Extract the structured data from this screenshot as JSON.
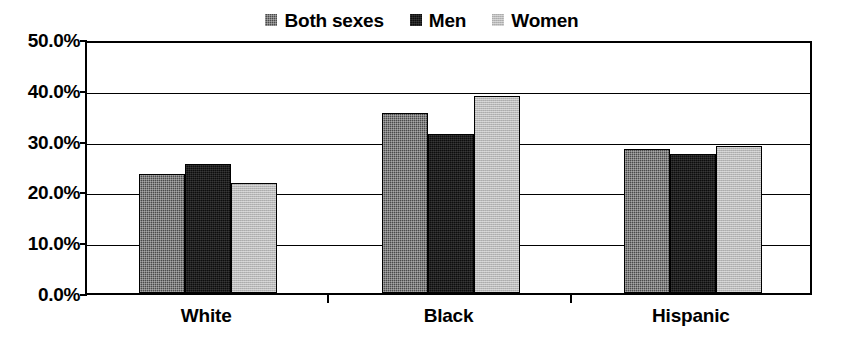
{
  "chart_data": {
    "type": "bar",
    "title": "",
    "subtitle": "",
    "xlabel": "",
    "ylabel": "",
    "categories": [
      "White",
      "Black",
      "Hispanic"
    ],
    "series": [
      {
        "name": "Both sexes",
        "color": "#4a4a4a",
        "values": [
          23.5,
          35.5,
          28.3
        ]
      },
      {
        "name": "Men",
        "color": "#0d0d0d",
        "values": [
          25.3,
          31.4,
          27.3
        ]
      },
      {
        "name": "Women",
        "color": "#b9b9b9",
        "values": [
          21.6,
          38.8,
          29.0
        ]
      }
    ],
    "ylim": [
      0,
      50
    ],
    "ytick_values": [
      50,
      40,
      30,
      20,
      10,
      0
    ],
    "ytick_labels": [
      "50.0%",
      "40.0%",
      "30.0%",
      "20.0%",
      "10.0%",
      "0.0%"
    ],
    "grid": true,
    "legend_position": "top-center",
    "value_suffix": "%"
  },
  "legend": {
    "items": [
      {
        "label": "Both sexes",
        "swatch": "fill-both"
      },
      {
        "label": "Men",
        "swatch": "fill-men"
      },
      {
        "label": "Women",
        "swatch": "fill-women"
      }
    ]
  }
}
